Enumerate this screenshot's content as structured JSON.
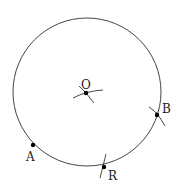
{
  "diagram": {
    "type": "geometric-construction",
    "circle": {
      "label": "circle"
    },
    "points": [
      {
        "id": "O",
        "label": "O",
        "role": "center"
      },
      {
        "id": "A",
        "label": "A",
        "role": "on-circle"
      },
      {
        "id": "R",
        "label": "R",
        "role": "on-circle"
      },
      {
        "id": "B",
        "label": "B",
        "role": "on-circle"
      }
    ],
    "colors": {
      "stroke": "#444444",
      "point": "#000000",
      "background": "#ffffff"
    }
  }
}
